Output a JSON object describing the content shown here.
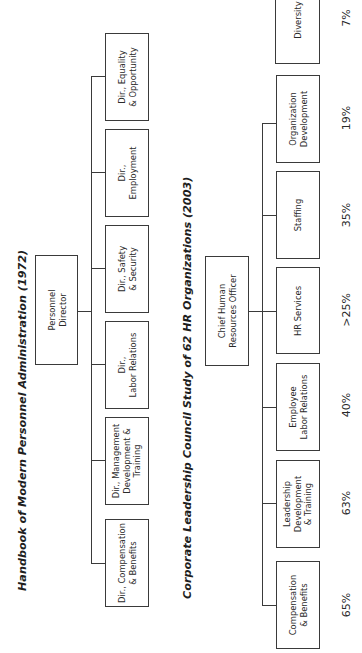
{
  "chart1": {
    "title": "Handbook of Modern Personnel Administration (1972)",
    "root": "Personnel\nDirector",
    "children": [
      {
        "label": "Dir., Equality\n& Opportunity"
      },
      {
        "label": "Dir.,\nEmployment"
      },
      {
        "label": "Dir., Safety\n& Security"
      },
      {
        "label": "Dir.,\nLabor Relations"
      },
      {
        "label": "Dir., Management\nDevelopment &\nTraining"
      },
      {
        "label": "Dir., Compensation\n& Benefits"
      }
    ]
  },
  "chart2": {
    "title": "Corporate Leadership Council Study of 62 HR Organizations (2003)",
    "root": "Chief Human\nResources Officer",
    "children": [
      {
        "label": "Diversity",
        "pct": "7%"
      },
      {
        "label": "Organization\nDevelopment",
        "pct": "19%"
      },
      {
        "label": "Staffing",
        "pct": "35%"
      },
      {
        "label": "HR Services",
        "pct": ">25%"
      },
      {
        "label": "Employee\nLabor Relations",
        "pct": "40%"
      },
      {
        "label": "Leadership\nDevelopment\n& Training",
        "pct": "63%"
      },
      {
        "label": "Compensation\n& Benefits",
        "pct": "65%"
      }
    ]
  },
  "colors": {
    "line": "#3a3a3a",
    "text": "#2a2a2a",
    "background": "#ffffff"
  }
}
